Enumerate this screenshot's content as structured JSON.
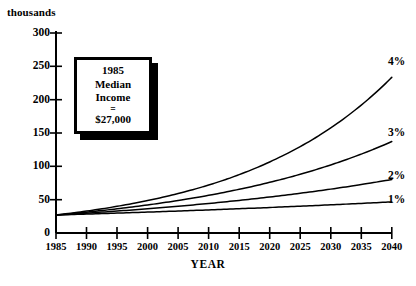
{
  "chart_data": {
    "type": "line",
    "title": "",
    "xlabel": "YEAR",
    "ylabel": "thousands",
    "xlim": [
      1985,
      2040
    ],
    "ylim": [
      0,
      300
    ],
    "grid": false,
    "legend_position": "right-of-curve-ends",
    "xticks": [
      "1985",
      "1990",
      "1995",
      "2000",
      "2005",
      "2010",
      "2015",
      "2020",
      "2025",
      "2030",
      "2035",
      "2040"
    ],
    "yticks": [
      "0",
      "50",
      "100",
      "150",
      "200",
      "250",
      "300"
    ],
    "x": [
      1985,
      1990,
      1995,
      2000,
      2005,
      2010,
      2015,
      2020,
      2025,
      2030,
      2035,
      2040
    ],
    "base_value": 27,
    "base_year": 1985,
    "series": [
      {
        "name": "4%",
        "rate_percent": 4,
        "values": [
          27,
          32.8,
          39.9,
          48.6,
          59.1,
          71.9,
          87.5,
          106.4,
          129.5,
          157.5,
          191.6,
          233.1
        ]
      },
      {
        "name": "3%",
        "rate_percent": 3,
        "values": [
          27,
          31.3,
          36.3,
          42.1,
          48.8,
          56.6,
          65.6,
          76.0,
          88.1,
          102.2,
          118.4,
          137.3
        ]
      },
      {
        "name": "2%",
        "rate_percent": 2,
        "values": [
          27,
          29.8,
          32.9,
          36.3,
          40.1,
          44.3,
          48.9,
          54.0,
          59.6,
          65.8,
          72.6,
          80.2
        ]
      },
      {
        "name": "1%",
        "rate_percent": 1,
        "values": [
          27,
          28.4,
          29.8,
          31.4,
          33.0,
          34.6,
          36.4,
          38.3,
          40.2,
          42.3,
          44.4,
          46.7
        ]
      }
    ],
    "annotation": {
      "line1": "1985",
      "line2": "Median",
      "line3": "Income",
      "line4": "=",
      "line5": "$27,000"
    }
  },
  "colors": {
    "background": "#ffffff",
    "ink": "#000000",
    "callout_shadow": "#000000"
  }
}
